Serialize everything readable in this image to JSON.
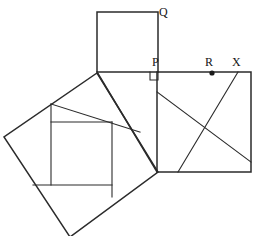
{
  "figure": {
    "type": "geometry-diagram",
    "canvas": {
      "width": 256,
      "height": 236,
      "background": "#ffffff"
    },
    "stroke_color": "#2b2b2b",
    "label_color": "#141414"
  },
  "labels": [
    {
      "id": "Q",
      "text": "Q",
      "x": 159,
      "y": 6,
      "role": "square-corner-label"
    },
    {
      "id": "P",
      "text": "P",
      "x": 152,
      "y": 56,
      "role": "right-angle-vertex-label"
    },
    {
      "id": "R",
      "text": "R",
      "x": 205,
      "y": 56,
      "role": "point-on-edge-label"
    },
    {
      "id": "X",
      "text": "X",
      "x": 232,
      "y": 56,
      "role": "point-on-edge-label"
    }
  ],
  "points": [
    {
      "id": "R-dot",
      "x": 212,
      "y": 73,
      "r": 2.6,
      "role": "marked-point"
    }
  ],
  "polygons": [
    {
      "id": "top-square",
      "name": "square-on-vertical-leg",
      "points": "97,12 158,12 158,72 97,72"
    },
    {
      "id": "right-square",
      "name": "square-on-hypotenuse",
      "points": "157,72 251,72 251,172 157,172"
    },
    {
      "id": "left-square",
      "name": "tilted-square-on-horizontal-leg",
      "points": "97,73 158,172 70,237 4,137"
    }
  ],
  "segments": [
    {
      "id": "triangle-hypotenuse",
      "name": "right-triangle-edge",
      "x1": 97,
      "y1": 72,
      "x2": 157,
      "y2": 172
    },
    {
      "id": "right-square-diag-a",
      "name": "diagonal-from-left-edge",
      "x1": 157,
      "y1": 92,
      "x2": 251,
      "y2": 162
    },
    {
      "id": "right-square-diag-b",
      "name": "diagonal-from-X",
      "x1": 238,
      "y1": 72,
      "x2": 178,
      "y2": 172
    },
    {
      "id": "dissect-h-upper",
      "name": "inner-horizontal-upper",
      "x1": 51,
      "y1": 122,
      "x2": 112,
      "y2": 122
    },
    {
      "id": "dissect-h-lower",
      "name": "inner-horizontal-lower",
      "x1": 33,
      "y1": 185,
      "x2": 112,
      "y2": 185
    },
    {
      "id": "dissect-v-left",
      "name": "inner-vertical-left",
      "x1": 51,
      "y1": 104,
      "x2": 51,
      "y2": 185
    },
    {
      "id": "dissect-v-right",
      "name": "inner-vertical-right",
      "x1": 112,
      "y1": 122,
      "x2": 112,
      "y2": 197
    },
    {
      "id": "dissect-top-ray",
      "name": "inner-top-edge-ray",
      "x1": 51,
      "y1": 104,
      "x2": 140,
      "y2": 132
    }
  ],
  "right_angle_marker": {
    "id": "right-angle-at-P",
    "name": "right-angle-square",
    "x": 150,
    "y": 72,
    "size": 8
  }
}
